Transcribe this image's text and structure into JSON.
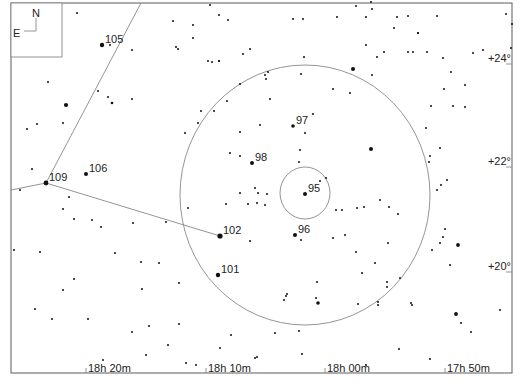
{
  "chart_data": {
    "type": "star-map",
    "frame": {
      "x": 11,
      "y": 3,
      "width": 501,
      "height": 370,
      "color": "#777777"
    },
    "compass": {
      "box": {
        "x": 11,
        "y": 3,
        "width": 51,
        "height": 54
      },
      "north": "N",
      "east": "E"
    },
    "ra_ticks": [
      {
        "label": "18h 20m",
        "x": 86
      },
      {
        "label": "18h 10m",
        "x": 206
      },
      {
        "label": "18h 00m",
        "x": 325
      },
      {
        "label": "17h 50m",
        "x": 445
      }
    ],
    "dec_ticks": [
      {
        "label": "+24°",
        "y": 60
      },
      {
        "label": "+22°",
        "y": 163
      },
      {
        "label": "+20°",
        "y": 268
      }
    ],
    "circles": [
      {
        "name": "field-of-view-outer",
        "cx": 305,
        "cy": 195,
        "rx": 125,
        "ry": 130
      },
      {
        "name": "field-of-view-inner",
        "cx": 305,
        "cy": 193,
        "rx": 25,
        "ry": 26
      }
    ],
    "lines": [
      {
        "x1": 46,
        "y1": 183,
        "x2": 141,
        "y2": 3
      },
      {
        "x1": 46,
        "y1": 183,
        "x2": 11,
        "y2": 190
      },
      {
        "x1": 46,
        "y1": 183,
        "x2": 220,
        "y2": 236
      }
    ],
    "labeled_stars": [
      {
        "label": "105",
        "x": 102,
        "y": 45,
        "r": 2.2
      },
      {
        "label": "106",
        "x": 86,
        "y": 174,
        "r": 2.0
      },
      {
        "label": "109",
        "x": 46,
        "y": 183,
        "r": 2.4
      },
      {
        "label": "97",
        "x": 293,
        "y": 126,
        "r": 1.8
      },
      {
        "label": "98",
        "x": 252,
        "y": 163,
        "r": 2.0
      },
      {
        "label": "95",
        "x": 305,
        "y": 194,
        "r": 2.0
      },
      {
        "label": "96",
        "x": 295,
        "y": 235,
        "r": 2.0
      },
      {
        "label": "102",
        "x": 220,
        "y": 236,
        "r": 2.6
      },
      {
        "label": "101",
        "x": 218,
        "y": 275,
        "r": 2.2
      }
    ],
    "stars": [
      [
        77,
        13,
        1
      ],
      [
        110,
        45,
        1
      ],
      [
        48,
        82,
        1
      ],
      [
        66,
        105,
        2.1
      ],
      [
        112,
        103,
        1.3
      ],
      [
        98,
        91,
        1
      ],
      [
        132,
        99,
        1
      ],
      [
        63,
        123,
        1
      ],
      [
        108,
        97,
        1
      ],
      [
        132,
        50,
        1
      ],
      [
        27,
        129,
        1
      ],
      [
        37,
        124,
        1
      ],
      [
        32,
        169,
        1
      ],
      [
        20,
        190,
        1
      ],
      [
        69,
        197,
        1
      ],
      [
        63,
        209,
        1
      ],
      [
        74,
        219,
        1
      ],
      [
        92,
        220,
        1
      ],
      [
        101,
        227,
        1
      ],
      [
        133,
        223,
        1
      ],
      [
        166,
        222,
        1
      ],
      [
        14,
        250,
        1
      ],
      [
        40,
        252,
        1
      ],
      [
        115,
        253,
        1
      ],
      [
        141,
        262,
        1
      ],
      [
        159,
        263,
        1
      ],
      [
        74,
        279,
        1
      ],
      [
        63,
        290,
        1
      ],
      [
        142,
        289,
        1
      ],
      [
        179,
        283,
        1
      ],
      [
        35,
        309,
        1
      ],
      [
        52,
        319,
        1
      ],
      [
        88,
        319,
        1
      ],
      [
        132,
        332,
        1
      ],
      [
        149,
        326,
        1
      ],
      [
        179,
        324,
        1
      ],
      [
        168,
        345,
        1
      ],
      [
        146,
        355,
        1
      ],
      [
        103,
        360,
        1
      ],
      [
        186,
        363,
        1
      ],
      [
        196,
        365,
        1
      ],
      [
        220,
        348,
        1
      ],
      [
        231,
        335,
        1
      ],
      [
        257,
        357,
        1
      ],
      [
        173,
        21,
        1
      ],
      [
        193,
        38,
        1
      ],
      [
        193,
        25,
        1
      ],
      [
        178,
        49,
        1
      ],
      [
        176,
        47,
        1
      ],
      [
        208,
        61,
        1
      ],
      [
        219,
        61,
        1
      ],
      [
        219,
        61,
        1
      ],
      [
        212,
        62,
        1
      ],
      [
        243,
        54,
        1
      ],
      [
        250,
        49,
        1
      ],
      [
        265,
        75,
        1
      ],
      [
        268,
        72,
        1
      ],
      [
        266,
        79,
        1
      ],
      [
        228,
        20,
        1
      ],
      [
        219,
        15,
        1
      ],
      [
        210,
        5,
        1
      ],
      [
        293,
        19,
        1
      ],
      [
        303,
        19,
        1
      ],
      [
        337,
        17,
        1
      ],
      [
        356,
        6,
        1
      ],
      [
        372,
        9,
        1
      ],
      [
        371,
        2,
        1
      ],
      [
        366,
        17,
        1
      ],
      [
        397,
        17,
        1
      ],
      [
        408,
        16,
        1
      ],
      [
        394,
        28,
        1
      ],
      [
        418,
        33,
        1
      ],
      [
        366,
        45,
        1
      ],
      [
        384,
        52,
        1
      ],
      [
        377,
        57,
        1
      ],
      [
        413,
        52,
        1
      ],
      [
        353,
        69,
        2
      ],
      [
        372,
        75,
        1
      ],
      [
        304,
        57,
        1
      ],
      [
        301,
        74,
        1
      ],
      [
        437,
        16,
        1
      ],
      [
        418,
        33,
        1
      ],
      [
        427,
        52,
        1
      ],
      [
        408,
        52,
        1
      ],
      [
        443,
        58,
        1
      ],
      [
        451,
        72,
        1
      ],
      [
        444,
        89,
        1
      ],
      [
        473,
        53,
        1
      ],
      [
        483,
        50,
        1
      ],
      [
        465,
        85,
        1
      ],
      [
        506,
        14,
        1
      ],
      [
        512,
        24,
        1
      ],
      [
        511,
        48,
        1
      ],
      [
        465,
        107,
        1
      ],
      [
        431,
        106,
        1
      ],
      [
        453,
        106,
        1
      ],
      [
        240,
        84,
        1
      ],
      [
        227,
        101,
        1
      ],
      [
        214,
        111,
        1
      ],
      [
        198,
        123,
        1
      ],
      [
        185,
        133,
        1
      ],
      [
        201,
        111,
        1
      ],
      [
        270,
        99,
        1
      ],
      [
        313,
        114,
        1
      ],
      [
        305,
        133,
        1
      ],
      [
        300,
        150,
        1
      ],
      [
        299,
        162,
        1
      ],
      [
        240,
        132,
        1
      ],
      [
        230,
        153,
        1
      ],
      [
        240,
        156,
        1
      ],
      [
        260,
        125,
        1
      ],
      [
        333,
        89,
        1
      ],
      [
        350,
        93,
        1
      ],
      [
        371,
        149,
        2
      ],
      [
        426,
        128,
        1
      ],
      [
        430,
        156,
        1
      ],
      [
        429,
        162,
        1
      ],
      [
        440,
        148,
        1
      ],
      [
        447,
        180,
        1
      ],
      [
        441,
        185,
        1
      ],
      [
        437,
        190,
        1
      ],
      [
        255,
        188,
        1
      ],
      [
        240,
        193,
        1
      ],
      [
        258,
        193,
        1
      ],
      [
        257,
        203,
        1
      ],
      [
        265,
        205,
        1
      ],
      [
        226,
        204,
        1
      ],
      [
        248,
        204,
        1
      ],
      [
        320,
        181,
        1
      ],
      [
        326,
        178,
        1
      ],
      [
        267,
        194,
        1
      ],
      [
        188,
        208,
        1
      ],
      [
        357,
        208,
        1
      ],
      [
        342,
        210,
        1
      ],
      [
        336,
        210,
        1
      ],
      [
        380,
        200,
        1
      ],
      [
        364,
        207,
        1
      ],
      [
        389,
        207,
        1
      ],
      [
        398,
        214,
        1
      ],
      [
        345,
        235,
        1
      ],
      [
        356,
        252,
        1
      ],
      [
        388,
        243,
        1
      ],
      [
        333,
        238,
        1
      ],
      [
        375,
        263,
        1
      ],
      [
        362,
        273,
        1
      ],
      [
        387,
        282,
        1
      ],
      [
        301,
        240,
        1
      ],
      [
        250,
        241,
        1
      ],
      [
        317,
        282,
        1
      ],
      [
        284,
        300,
        1
      ],
      [
        286,
        296,
        1
      ],
      [
        287,
        294,
        1
      ],
      [
        316,
        298,
        1
      ],
      [
        318,
        303,
        1.8
      ],
      [
        299,
        331,
        1
      ],
      [
        275,
        333,
        1
      ],
      [
        255,
        358,
        1
      ],
      [
        302,
        354,
        1
      ],
      [
        366,
        365,
        1
      ],
      [
        378,
        302,
        1
      ],
      [
        378,
        305,
        1
      ],
      [
        387,
        287,
        1
      ],
      [
        358,
        304,
        1
      ],
      [
        412,
        305,
        1
      ],
      [
        411,
        303,
        1
      ],
      [
        400,
        278,
        1
      ],
      [
        432,
        250,
        1
      ],
      [
        440,
        243,
        1
      ],
      [
        443,
        237,
        1
      ],
      [
        445,
        229,
        1
      ],
      [
        458,
        245,
        1.9
      ],
      [
        450,
        265,
        1
      ],
      [
        456,
        314,
        1.9
      ],
      [
        461,
        323,
        1
      ],
      [
        471,
        332,
        1
      ],
      [
        500,
        310,
        1
      ],
      [
        430,
        359,
        1
      ],
      [
        399,
        349,
        1
      ]
    ]
  }
}
